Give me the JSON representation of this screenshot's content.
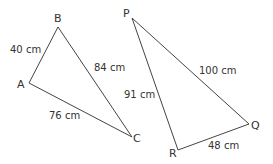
{
  "triangle_abc": {
    "vertices": {
      "A": "A",
      "B": "B",
      "C": "C"
    },
    "sides": {
      "AB": "40 cm",
      "BC": "84 cm",
      "AC": "76 cm"
    }
  },
  "triangle_pqr": {
    "vertices": {
      "P": "P",
      "Q": "Q",
      "R": "R"
    },
    "sides": {
      "PQ": "100 cm",
      "PR": "91 cm",
      "RQ": "48 cm"
    }
  },
  "colors": {
    "line": "#444444",
    "text": "#333333"
  }
}
